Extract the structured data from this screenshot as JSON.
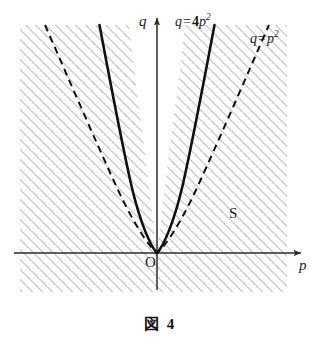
{
  "figure": {
    "caption": "図 4",
    "axes": {
      "x_label": "p",
      "y_label": "q",
      "origin_label": "O",
      "origin_px": {
        "x": 157,
        "y": 253
      },
      "x_axis_y_px": 253,
      "y_axis_x_px": 157,
      "x_axis_extent_px": {
        "from": 14,
        "to": 303
      },
      "y_axis_extent_px": {
        "from": 16,
        "to": 290
      }
    },
    "curves": [
      {
        "id": "curve-solid",
        "label_text": "q = 4p²",
        "label_parts": {
          "lhs": "q",
          "eq": "=",
          "coef": "4",
          "var": "p",
          "exp": "2"
        },
        "equation": "q = 4p^2",
        "coefficient": 4,
        "style": "solid",
        "color": "#111111",
        "width_px": 2.6
      },
      {
        "id": "curve-dashed",
        "label_text": "q = p²",
        "label_parts": {
          "lhs": "q",
          "eq": "=",
          "coef": "",
          "var": "p",
          "exp": "2"
        },
        "equation": "q = p^2",
        "coefficient": 1,
        "style": "dashed",
        "color": "#111111",
        "width_px": 2.0,
        "dash_pattern": "7,5"
      }
    ],
    "region": {
      "label": "S",
      "description": "hatched region outside q = 4p^2",
      "hatch_color": "#7a7a7a",
      "hatch_angle_deg": 45,
      "hatch_spacing_px": 5,
      "bounds_px": {
        "left": 20,
        "top": 25,
        "right": 287,
        "bottom": 292
      }
    },
    "colors": {
      "ink": "#111111",
      "axis": "#2b2b2b",
      "hatch": "#7a7a7a",
      "background": "#ffffff"
    }
  }
}
